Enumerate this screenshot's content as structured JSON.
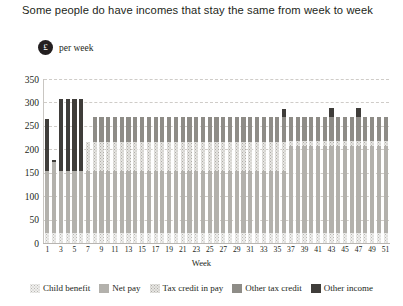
{
  "title": "Some people do have incomes that stay the same from week to week",
  "unit": {
    "badge": "£",
    "label": "per week",
    "badge_icon": "pound-coin-icon"
  },
  "colors": {
    "child_benefit": "#efefed",
    "net_pay": "#b3b1ac",
    "tax_credit_in_pay": "#e6e5e2",
    "other_tax_credit": "#8e8c87",
    "other_income": "#3f3d3a",
    "grid": "#cfccc8",
    "axis": "#b8b5b1",
    "text": "#231f20"
  },
  "chart_data": {
    "type": "bar",
    "stacked": true,
    "title": "Some people do have incomes that stay the same from week to week",
    "xlabel": "Week",
    "ylabel": "£ per week",
    "ylim": [
      0,
      350
    ],
    "yticks": [
      0,
      50,
      100,
      150,
      200,
      250,
      300,
      350
    ],
    "grid": true,
    "legend_position": "bottom",
    "categories": [
      1,
      2,
      3,
      4,
      5,
      6,
      7,
      8,
      9,
      10,
      11,
      12,
      13,
      14,
      15,
      16,
      17,
      18,
      19,
      20,
      21,
      22,
      23,
      24,
      25,
      26,
      27,
      28,
      29,
      30,
      31,
      32,
      33,
      34,
      35,
      36,
      37,
      38,
      39,
      40,
      41,
      42,
      43,
      44,
      45,
      46,
      47,
      48,
      49,
      50,
      51
    ],
    "xtick_labels": [
      "1",
      "3",
      "5",
      "7",
      "9",
      "11",
      "13",
      "15",
      "17",
      "19",
      "21",
      "23",
      "25",
      "27",
      "29",
      "31",
      "33",
      "35",
      "37",
      "39",
      "41",
      "43",
      "45",
      "47",
      "49",
      "51"
    ],
    "series": [
      {
        "name": "Child benefit",
        "color": "#efefed",
        "values": [
          21,
          21,
          21,
          21,
          21,
          21,
          21,
          21,
          21,
          21,
          21,
          21,
          21,
          21,
          21,
          21,
          21,
          21,
          21,
          21,
          21,
          21,
          21,
          21,
          21,
          21,
          21,
          21,
          21,
          21,
          21,
          21,
          21,
          21,
          21,
          21,
          21,
          21,
          21,
          21,
          21,
          21,
          21,
          21,
          21,
          21,
          21,
          21,
          21,
          21,
          21
        ]
      },
      {
        "name": "Net pay",
        "color": "#b3b1ac",
        "values": [
          133,
          152,
          133,
          133,
          133,
          133,
          133,
          133,
          133,
          133,
          133,
          133,
          133,
          133,
          133,
          133,
          133,
          133,
          133,
          133,
          133,
          133,
          133,
          133,
          133,
          133,
          133,
          133,
          133,
          133,
          133,
          133,
          133,
          133,
          133,
          133,
          187,
          187,
          187,
          187,
          187,
          187,
          187,
          187,
          187,
          187,
          187,
          187,
          187,
          187,
          187
        ]
      },
      {
        "name": "Tax credit in pay",
        "color": "#e6e5e2",
        "values": [
          0,
          0,
          0,
          0,
          0,
          0,
          62,
          62,
          62,
          62,
          62,
          62,
          62,
          62,
          62,
          62,
          62,
          62,
          62,
          62,
          62,
          62,
          62,
          62,
          62,
          62,
          62,
          62,
          62,
          62,
          62,
          62,
          62,
          62,
          62,
          62,
          10,
          10,
          10,
          10,
          10,
          10,
          10,
          10,
          10,
          10,
          10,
          10,
          10,
          10,
          10
        ]
      },
      {
        "name": "Other tax credit",
        "color": "#8e8c87",
        "values": [
          0,
          0,
          0,
          0,
          0,
          0,
          0,
          52,
          52,
          52,
          52,
          52,
          52,
          52,
          52,
          52,
          52,
          52,
          52,
          52,
          52,
          52,
          52,
          52,
          52,
          52,
          52,
          52,
          52,
          52,
          52,
          52,
          52,
          52,
          52,
          52,
          52,
          52,
          52,
          52,
          52,
          52,
          52,
          52,
          52,
          52,
          52,
          52,
          52,
          52,
          52
        ]
      },
      {
        "name": "Other income",
        "color": "#3f3d3a",
        "values": [
          111,
          4,
          153,
          153,
          153,
          153,
          0,
          0,
          0,
          0,
          0,
          0,
          0,
          0,
          0,
          0,
          0,
          0,
          0,
          0,
          0,
          0,
          0,
          0,
          0,
          0,
          0,
          0,
          0,
          0,
          0,
          0,
          0,
          0,
          0,
          18,
          0,
          0,
          0,
          0,
          0,
          0,
          18,
          0,
          0,
          0,
          18,
          0,
          0,
          0,
          0
        ]
      }
    ],
    "totals": [
      265,
      177,
      307,
      307,
      307,
      307,
      216,
      268,
      268,
      268,
      268,
      268,
      268,
      268,
      268,
      268,
      268,
      268,
      268,
      268,
      268,
      268,
      268,
      268,
      268,
      268,
      268,
      268,
      268,
      268,
      268,
      268,
      268,
      268,
      268,
      286,
      270,
      270,
      270,
      270,
      270,
      270,
      288,
      270,
      270,
      270,
      288,
      270,
      270,
      270,
      270
    ]
  },
  "legend": [
    {
      "label": "Child benefit",
      "swatch": "s-child"
    },
    {
      "label": "Net pay",
      "swatch": "s-net"
    },
    {
      "label": "Tax credit in pay",
      "swatch": "s-tcp"
    },
    {
      "label": "Other tax credit",
      "swatch": "s-otc"
    },
    {
      "label": "Other income",
      "swatch": "s-oi"
    }
  ]
}
